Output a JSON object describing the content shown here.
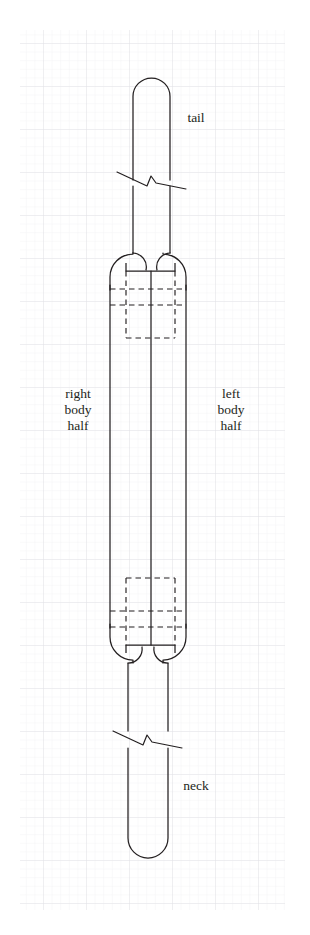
{
  "figure": {
    "background_color": "#ffffff",
    "line_color": "#231f20",
    "grid": {
      "minor_color": "#f2f2f4",
      "major_color": "#e2e2e6",
      "minor_spacing_px": 8.6,
      "major_spacing_px": 43,
      "origin_x": 20,
      "origin_y": 30,
      "width": 265,
      "height": 880
    },
    "labels": [
      {
        "id": "tail",
        "text": "tail",
        "x": 196,
        "y": 122,
        "align": "middle"
      },
      {
        "id": "right-body-half",
        "lines": [
          "right",
          "body",
          "half"
        ],
        "x": 78,
        "y": 398,
        "line_height": 16
      },
      {
        "id": "left-body-half",
        "lines": [
          "left",
          "body",
          "half"
        ],
        "x": 231,
        "y": 398,
        "line_height": 16
      },
      {
        "id": "neck",
        "text": "neck",
        "x": 196,
        "y": 790,
        "align": "middle"
      }
    ],
    "geometry": {
      "tail": {
        "left_x": 133,
        "right_x": 170,
        "tip_y": 78,
        "cap_radius": 18.5,
        "break_y": 178,
        "bottom_y": 253
      },
      "neck": {
        "left_x": 128,
        "right_x": 168,
        "tip_y": 858,
        "cap_radius": 20,
        "break_y": 737,
        "top_y": 663
      },
      "body": {
        "left_x": 110,
        "right_x": 186,
        "center_x": 151,
        "top_y": 249,
        "bottom_y": 665,
        "cap_radius": 38,
        "top_cap_center_y": 287,
        "bottom_cap_center_y": 627
      },
      "hidden_detail_top": {
        "dashed_rect_x1": 126,
        "dashed_rect_x2": 175,
        "dashed_rect_y1": 263,
        "dashed_rect_y2": 338,
        "dashed_h_line_1_y": 289,
        "dashed_h_line_2_y": 305,
        "solid_shoulder_y": 271
      },
      "hidden_detail_bottom": {
        "dashed_rect_x1": 126,
        "dashed_rect_x2": 175,
        "dashed_rect_y1": 578,
        "dashed_rect_y2": 653,
        "dashed_h_line_1_y": 611,
        "dashed_h_line_2_y": 627,
        "solid_shoulder_y": 645
      }
    },
    "stroke_widths": {
      "outline": 1.25,
      "dashed": 1.2,
      "break": 1.2
    }
  }
}
